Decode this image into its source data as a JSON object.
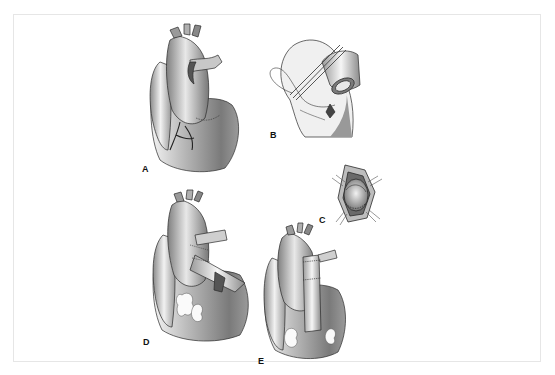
{
  "figure": {
    "panels": [
      {
        "id": "A",
        "label": "A",
        "description": "Heart, anterior view with coronary arteries"
      },
      {
        "id": "B",
        "label": "B",
        "description": "Aortic root with suture loop"
      },
      {
        "id": "C",
        "label": "C",
        "description": "Retracted opening showing valve"
      },
      {
        "id": "D",
        "label": "D",
        "description": "Heart with graft conduit"
      },
      {
        "id": "E",
        "label": "E",
        "description": "Heart with completed tube graft"
      }
    ]
  },
  "colors": {
    "frame": "#e6e6e6",
    "tissue_dark": "#6e6e6e",
    "tissue_mid": "#a8a8a8",
    "tissue_light": "#eeeeee",
    "outline": "#2a2a2a"
  }
}
